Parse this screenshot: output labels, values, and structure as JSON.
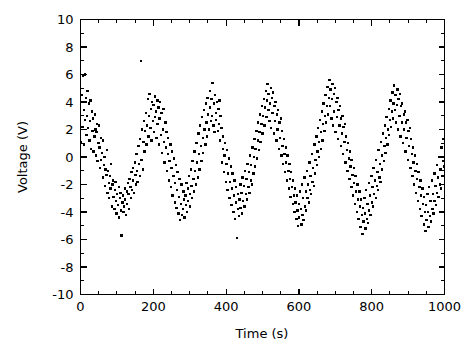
{
  "chart_data": {
    "type": "scatter",
    "title": "",
    "xlabel": "Time (s)",
    "ylabel": "Voltage (V)",
    "xlim": [
      0,
      1000
    ],
    "ylim": [
      -10,
      10
    ],
    "xticks": [
      0,
      200,
      400,
      600,
      800,
      1000
    ],
    "yticks": [
      -10,
      -8,
      -6,
      -4,
      -2,
      0,
      2,
      4,
      6,
      8,
      10
    ],
    "xtick_labels": [
      "0",
      "200",
      "400",
      "600",
      "800",
      "1000"
    ],
    "ytick_labels": [
      "-10",
      "-8",
      "-6",
      "-4",
      "-2",
      "0",
      "2",
      "4",
      "6",
      "8",
      "10"
    ],
    "x_minor_tick_interval": 50,
    "y_minor_tick_interval": 1,
    "grid": false,
    "legend": null,
    "marker": "square",
    "marker_size_px": 2.4,
    "marker_color": "#000000",
    "background_color": "#ffffff",
    "frame_color": "#000000",
    "signal_model": {
      "amplitude": 3.0,
      "period": 90,
      "phase_deg": 0,
      "offset": 0.0,
      "noise_sigma": 1.1,
      "n_points": 620
    },
    "x": [
      2,
      4,
      5,
      7,
      9,
      10,
      12,
      13,
      15,
      16,
      18,
      19,
      21,
      23,
      25,
      26,
      28,
      29,
      31,
      33,
      34,
      36,
      38,
      39,
      41,
      43,
      44,
      46,
      47,
      49,
      51,
      52,
      54,
      56,
      57,
      59,
      61,
      62,
      64,
      66,
      68,
      69,
      71,
      72,
      74,
      76,
      78,
      79,
      81,
      82,
      84,
      86,
      88,
      89,
      91,
      93,
      95,
      96,
      98,
      99,
      101,
      103,
      105,
      106,
      108,
      110,
      111,
      113,
      115,
      116,
      118,
      120,
      122,
      123,
      125,
      127,
      128,
      130,
      132,
      133,
      135,
      137,
      139,
      140,
      142,
      144,
      145,
      147,
      149,
      151,
      152,
      154,
      156,
      157,
      159,
      161,
      163,
      164,
      166,
      168,
      169,
      171,
      173,
      175,
      176,
      178,
      180,
      181,
      183,
      185,
      187,
      188,
      190,
      192,
      193,
      195,
      197,
      199,
      200,
      202,
      204,
      205,
      207,
      209,
      211,
      212,
      214,
      216,
      217,
      219,
      221,
      223,
      224,
      226,
      228,
      229,
      231,
      233,
      235,
      236,
      238,
      240,
      241,
      243,
      245,
      247,
      248,
      250,
      252,
      253,
      255,
      257,
      259,
      260,
      262,
      264,
      265,
      267,
      269,
      271,
      272,
      274,
      276,
      277,
      279,
      281,
      283,
      284,
      286,
      288,
      289,
      291,
      293,
      295,
      296,
      298,
      300,
      301,
      303,
      305,
      307,
      308,
      310,
      312,
      313,
      315,
      317,
      319,
      320,
      322,
      324,
      325,
      327,
      329,
      331,
      332,
      334,
      336,
      337,
      339,
      341,
      343,
      344,
      346,
      348,
      349,
      351,
      353,
      355,
      356,
      358,
      360,
      361,
      363,
      365,
      367,
      368,
      370,
      372,
      373,
      375,
      377,
      379,
      380,
      382,
      384,
      385,
      387,
      389,
      391,
      392,
      394,
      396,
      397,
      399,
      401,
      403,
      404,
      406,
      408,
      409,
      411,
      413,
      415,
      416,
      418,
      420,
      421,
      423,
      425,
      427,
      428,
      430,
      432,
      433,
      435,
      437,
      439,
      440,
      442,
      444,
      445,
      447,
      449,
      451,
      452,
      454,
      456,
      457,
      459,
      461,
      463,
      464,
      466,
      468,
      469,
      471,
      473,
      475,
      476,
      478,
      480,
      481,
      483,
      485,
      487,
      488,
      490,
      492,
      493,
      495,
      497,
      499,
      500,
      502,
      504,
      505,
      507,
      509,
      511,
      512,
      514,
      516,
      517,
      519,
      521,
      523,
      524,
      526,
      528,
      529,
      531,
      533,
      535,
      536,
      538,
      540,
      541,
      543,
      545,
      547,
      548,
      550,
      552,
      553,
      555,
      557,
      559,
      560,
      562,
      564,
      565,
      567,
      569,
      571,
      572,
      574,
      576,
      577,
      579,
      581,
      583,
      584,
      586,
      588,
      589,
      591,
      593,
      595,
      596,
      598,
      600,
      601,
      603,
      605,
      607,
      608,
      610,
      612,
      613,
      615,
      617,
      619,
      620,
      622,
      624,
      625,
      627,
      629,
      631,
      632,
      634,
      636,
      637,
      639,
      641,
      643,
      644,
      646,
      648,
      649,
      651,
      653,
      655,
      656,
      658,
      660,
      661,
      663,
      665,
      667,
      668,
      670,
      672,
      673,
      675,
      677,
      679,
      680,
      682,
      684,
      685,
      687,
      689,
      691,
      692,
      694,
      696,
      697,
      699,
      701,
      703,
      704,
      706,
      708,
      709,
      711,
      713,
      715,
      716,
      718,
      720,
      721,
      723,
      725,
      727,
      728,
      730,
      732,
      733,
      735,
      737,
      739,
      740,
      742,
      744,
      745,
      747,
      749,
      751,
      752,
      754,
      756,
      757,
      759,
      761,
      763,
      764,
      766,
      768,
      769,
      771,
      773,
      775,
      776,
      778,
      780,
      781,
      783,
      785,
      787,
      788,
      790,
      792,
      793,
      795,
      797,
      799,
      800,
      802,
      804,
      805,
      807,
      809,
      811,
      812,
      814,
      816,
      817,
      819,
      821,
      823,
      824,
      826,
      828,
      829,
      831,
      833,
      835,
      836,
      838,
      840,
      841,
      843,
      845,
      847,
      848,
      850,
      852,
      853,
      855,
      857,
      859,
      860,
      862,
      864,
      865,
      867,
      869,
      871,
      872,
      874,
      876,
      877,
      879,
      881,
      883,
      884,
      886,
      888,
      889,
      891,
      893,
      895,
      896,
      898,
      900,
      901,
      903,
      905,
      907,
      908,
      910,
      912,
      913,
      915,
      917,
      919,
      920,
      922,
      924,
      925,
      927,
      929,
      931,
      932,
      934,
      936,
      937,
      939,
      941,
      943,
      944,
      946,
      948,
      949,
      951,
      953,
      955,
      956,
      958,
      960,
      961,
      963,
      965,
      967,
      968,
      970,
      972,
      973,
      975,
      977,
      979,
      980,
      982,
      984,
      985,
      987,
      989,
      991,
      992,
      994,
      996,
      997,
      999
    ],
    "y": [
      1.1,
      4.5,
      2.2,
      5.9,
      3.4,
      0.9,
      6.0,
      2.7,
      4.3,
      1.6,
      3.0,
      4.8,
      2.1,
      3.9,
      1.2,
      2.6,
      4.1,
      0.6,
      3.3,
      1.9,
      2.8,
      0.4,
      1.5,
      3.1,
      2.0,
      0.1,
      1.8,
      2.4,
      -0.3,
      1.0,
      2.3,
      0.7,
      -0.8,
      1.4,
      -0.2,
      0.3,
      -1.5,
      1.2,
      -0.6,
      0.0,
      -2.1,
      -0.9,
      -1.3,
      0.5,
      -2.6,
      -1.0,
      -1.9,
      -3.0,
      -1.4,
      -2.3,
      -0.5,
      -3.6,
      -2.0,
      -1.7,
      -2.9,
      -3.8,
      -2.4,
      -1.8,
      -3.2,
      -4.1,
      -2.7,
      -3.5,
      -2.2,
      -4.4,
      -3.0,
      -2.6,
      -3.9,
      -5.7,
      -3.3,
      -2.8,
      -4.0,
      -3.6,
      -2.3,
      -3.1,
      -4.2,
      -2.5,
      -3.4,
      -1.9,
      -2.7,
      -3.8,
      -1.6,
      -2.2,
      -3.0,
      -1.1,
      -2.4,
      -0.8,
      -1.7,
      -2.6,
      -0.4,
      -1.3,
      -2.0,
      0.2,
      -1.0,
      -1.8,
      0.8,
      -0.5,
      -1.4,
      1.3,
      7.0,
      -0.2,
      2.0,
      -0.9,
      1.1,
      2.6,
      0.4,
      1.9,
      3.2,
      0.9,
      2.3,
      4.2,
      1.5,
      3.0,
      4.6,
      2.1,
      3.5,
      1.2,
      4.0,
      2.6,
      3.8,
      1.8,
      4.4,
      2.9,
      3.3,
      1.4,
      4.1,
      2.4,
      3.6,
      0.9,
      2.8,
      4.0,
      1.6,
      3.2,
      0.3,
      2.0,
      3.5,
      1.1,
      -0.4,
      2.5,
      0.7,
      1.8,
      -1.0,
      0.2,
      1.4,
      -1.7,
      -0.3,
      0.9,
      -2.2,
      -0.8,
      0.4,
      -2.8,
      -1.4,
      -0.1,
      -3.3,
      -1.9,
      -0.6,
      -3.7,
      -2.4,
      -1.1,
      -4.1,
      -2.9,
      -1.6,
      -4.6,
      -3.4,
      -2.0,
      -4.2,
      -3.8,
      -2.5,
      -3.1,
      -4.4,
      -2.8,
      -3.5,
      -1.9,
      -4.0,
      -2.3,
      -3.2,
      -1.4,
      -2.7,
      -3.6,
      -0.9,
      -2.1,
      -3.0,
      -0.3,
      -1.6,
      -2.5,
      0.4,
      -1.0,
      -2.0,
      1.0,
      -0.4,
      -1.5,
      1.7,
      0.2,
      -0.9,
      2.3,
      0.8,
      -0.3,
      2.9,
      1.4,
      0.3,
      3.4,
      2.0,
      0.9,
      3.9,
      2.5,
      1.5,
      4.3,
      3.1,
      2.0,
      4.8,
      3.6,
      2.6,
      4.2,
      3.0,
      5.4,
      2.3,
      3.9,
      1.8,
      4.5,
      3.2,
      2.7,
      4.0,
      1.9,
      3.5,
      2.4,
      4.1,
      1.2,
      3.0,
      2.1,
      -0.4,
      0.6,
      1.5,
      -1.1,
      0.1,
      1.0,
      -1.8,
      -0.5,
      0.5,
      -2.4,
      -1.2,
      -0.1,
      -3.0,
      -1.8,
      -0.7,
      -3.5,
      -2.3,
      -1.2,
      -4.0,
      -2.8,
      -1.7,
      -4.5,
      -3.3,
      -2.2,
      -5.9,
      -3.8,
      -2.7,
      -4.3,
      -3.1,
      -2.0,
      -3.7,
      -2.6,
      -4.1,
      -1.5,
      -3.2,
      -2.1,
      -3.6,
      -1.0,
      -2.7,
      -1.6,
      -3.1,
      -0.5,
      -2.2,
      -1.1,
      -2.6,
      0.1,
      -1.7,
      -0.6,
      -2.0,
      0.7,
      -1.2,
      0.0,
      1.3,
      -0.7,
      0.6,
      1.9,
      -0.1,
      1.2,
      2.5,
      0.5,
      1.8,
      3.1,
      1.1,
      2.4,
      3.7,
      1.7,
      3.0,
      4.2,
      2.3,
      3.6,
      4.8,
      2.9,
      4.1,
      5.3,
      3.4,
      4.6,
      2.6,
      3.9,
      5.0,
      2.1,
      4.3,
      3.2,
      4.7,
      1.7,
      3.7,
      2.6,
      4.0,
      1.2,
      3.1,
      2.0,
      3.4,
      0.6,
      2.5,
      1.4,
      2.8,
      0.1,
      1.9,
      0.8,
      -0.5,
      1.3,
      0.2,
      -1.1,
      0.7,
      -0.4,
      -1.7,
      0.1,
      -1.0,
      -2.3,
      -0.5,
      -1.6,
      -2.9,
      -1.1,
      -2.2,
      -3.4,
      -1.7,
      -2.8,
      -4.0,
      -2.3,
      -3.3,
      -4.5,
      -2.8,
      -3.9,
      -5.0,
      -3.4,
      -4.4,
      -2.5,
      -3.8,
      -4.9,
      -2.0,
      -4.2,
      -3.0,
      -4.6,
      -1.5,
      -3.6,
      -2.5,
      -3.9,
      -1.0,
      -3.0,
      -2.0,
      -3.3,
      -0.4,
      -2.4,
      -1.4,
      -2.7,
      0.2,
      -1.8,
      -0.8,
      -2.1,
      0.9,
      -1.2,
      -0.2,
      1.5,
      -0.6,
      0.4,
      2.1,
      0.0,
      1.1,
      2.7,
      0.6,
      1.8,
      3.3,
      1.2,
      2.4,
      3.9,
      1.9,
      3.0,
      4.5,
      2.5,
      3.7,
      5.1,
      3.1,
      4.3,
      5.6,
      3.7,
      4.9,
      2.8,
      4.2,
      5.3,
      2.3,
      4.6,
      3.3,
      5.0,
      1.8,
      4.0,
      2.9,
      4.3,
      1.3,
      3.4,
      2.3,
      3.7,
      0.8,
      2.8,
      1.7,
      3.0,
      0.2,
      2.2,
      1.1,
      2.4,
      -0.4,
      1.5,
      0.5,
      -1.0,
      1.0,
      -0.1,
      -1.6,
      0.4,
      -0.7,
      -2.2,
      -0.2,
      -1.3,
      -2.8,
      -0.8,
      -1.9,
      -3.4,
      -1.4,
      -2.5,
      -4.0,
      -2.0,
      -3.1,
      -4.5,
      -2.5,
      -3.6,
      -5.1,
      -3.1,
      -4.2,
      -5.6,
      -3.7,
      -4.7,
      -3.0,
      -4.1,
      -5.2,
      -2.4,
      -4.5,
      -3.4,
      -4.8,
      -1.9,
      -3.9,
      -2.8,
      -4.2,
      -1.4,
      -3.3,
      -2.2,
      -3.6,
      -0.8,
      -2.7,
      -1.7,
      -3.0,
      -0.2,
      -2.1,
      -1.1,
      -2.4,
      0.5,
      -1.5,
      -0.5,
      -1.8,
      1.1,
      -0.9,
      0.1,
      1.7,
      -0.3,
      0.8,
      2.3,
      0.3,
      1.4,
      2.9,
      0.9,
      2.0,
      3.5,
      1.6,
      2.7,
      4.1,
      2.2,
      3.3,
      4.7,
      2.8,
      3.9,
      5.2,
      3.4,
      4.5,
      2.5,
      3.8,
      4.9,
      2.0,
      4.2,
      3.0,
      4.6,
      1.5,
      3.7,
      2.5,
      3.9,
      1.0,
      3.1,
      2.0,
      3.3,
      0.4,
      2.5,
      1.4,
      2.7,
      -0.2,
      1.9,
      0.8,
      2.1,
      -0.8,
      1.3,
      0.2,
      -1.4,
      0.7,
      -0.4,
      -2.0,
      0.1,
      -1.0,
      -2.6,
      -0.5,
      -1.6,
      -3.2,
      -1.1,
      -2.2,
      -3.8,
      -1.7,
      -2.8,
      -4.3,
      -2.3,
      -3.4,
      -4.9,
      -2.9,
      -4.0,
      -5.4,
      -3.5,
      -4.6,
      -2.7,
      -4.0,
      -5.1,
      -2.2,
      -4.3,
      -3.2,
      -4.7,
      -1.7,
      -3.8,
      -2.7,
      -4.1,
      -1.2,
      -3.2,
      -2.1,
      -3.5,
      -0.6,
      -2.6,
      -1.5,
      -2.9,
      0.0,
      -2.0,
      -0.9,
      -2.3,
      0.7,
      -1.4,
      -0.3,
      1.3,
      -0.7,
      0.3,
      1.9,
      -0.1,
      1.0,
      2.5,
      0.5,
      1.6,
      3.1,
      1.2,
      2.2,
      3.7,
      1.8,
      2.9,
      4.3,
      2.4,
      3.5,
      4.9,
      3.0,
      4.1,
      5.4,
      3.6,
      4.7,
      2.7,
      4.0,
      5.1,
      2.2,
      4.4,
      3.2,
      4.8,
      1.7,
      3.9,
      2.8,
      4.2,
      1.2,
      3.4,
      2.3,
      3.6,
      0.7,
      2.8,
      1.7,
      3.0,
      0.1,
      2.2,
      1.1,
      2.4,
      -0.5,
      1.6,
      0.5,
      -1.1,
      1.0,
      -0.1,
      -1.7,
      0.4,
      -0.7,
      -2.3,
      -0.2,
      -1.3,
      -2.9,
      -0.8,
      -1.9,
      -3.5,
      -1.4,
      -2.5,
      -4.1,
      -2.0,
      -3.1,
      -4.6,
      -2.6,
      -3.7,
      -5.2,
      -3.2,
      -4.3,
      -3.8,
      -2.6,
      -4.0,
      -3.0,
      -1.9,
      -3.4,
      -2.3,
      -0.7,
      -2.8,
      -1.6,
      -0.2,
      -2.1,
      -1.0,
      0.5,
      -1.5,
      -0.3
    ]
  },
  "axes": {
    "x_axis_title": "Time (s)",
    "y_axis_title": "Voltage (V)"
  }
}
